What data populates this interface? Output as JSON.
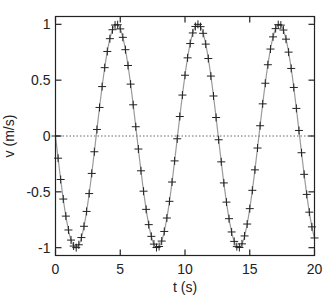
{
  "chart_data": {
    "type": "line",
    "title": "",
    "xlabel": "t (s)",
    "ylabel": "v (m/s)",
    "xlim": [
      0,
      20
    ],
    "ylim": [
      -1.07,
      1.07
    ],
    "xticks": [
      0,
      5,
      10,
      15,
      20
    ],
    "xtick_labels": [
      "0",
      "5",
      "10",
      "15",
      "20"
    ],
    "yticks": [
      -1,
      -0.5,
      0,
      0.5,
      1
    ],
    "ytick_labels": [
      "-1",
      "-0.5",
      "0",
      "0.5",
      "1"
    ],
    "grid": false,
    "legend": null,
    "series": [
      {
        "name": "v(t) = -sin(t)",
        "style": "gray line with '+' markers",
        "function": "-sin(t)",
        "t_start": 0,
        "t_end": 20,
        "dt": 0.2
      },
      {
        "name": "zero reference",
        "style": "dotted",
        "values": [
          0,
          0
        ],
        "x": [
          0,
          20
        ]
      }
    ],
    "colors": {
      "curve": "#9a9a9a",
      "markers": "#222222",
      "zero_line": "#666666",
      "axes": "#222222"
    }
  }
}
